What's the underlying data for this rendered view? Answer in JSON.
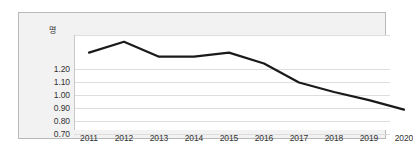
{
  "chart_data": {
    "type": "line",
    "title": "",
    "xlabel": "",
    "ylabel": "명",
    "categories": [
      "2011",
      "2012",
      "2013",
      "2014",
      "2015",
      "2016",
      "2017",
      "2018",
      "2019",
      "2020"
    ],
    "values": [
      1.27,
      1.35,
      1.24,
      1.24,
      1.27,
      1.19,
      1.05,
      0.98,
      0.92,
      0.85
    ],
    "series": [
      {
        "name": "",
        "values": [
          1.27,
          1.35,
          1.24,
          1.24,
          1.27,
          1.19,
          1.05,
          0.98,
          0.92,
          0.85
        ]
      }
    ],
    "y_tick_labels": [
      "1.20",
      "1.10",
      "1.00",
      "0.90",
      "0.80",
      "0.70"
    ],
    "y_tick_values": [
      1.2,
      1.1,
      1.0,
      0.9,
      0.8,
      0.7
    ],
    "ylim": [
      0.7,
      1.4
    ],
    "xlim": [
      "2011",
      "2020"
    ],
    "grid": true,
    "grid_axis": "y",
    "legend": false,
    "legend_position": "none",
    "markers": false,
    "annotations": []
  },
  "style": {
    "line_color": "#1a1a1a",
    "line_width": 2.2,
    "panel_background": "#f2f2f2",
    "plot_background": "#ffffff",
    "panel_border_color": "#b9b9b9",
    "gridline_color": "#dedede",
    "axis_line_color": "#c8c8c8",
    "tick_label_color": "#333333"
  }
}
